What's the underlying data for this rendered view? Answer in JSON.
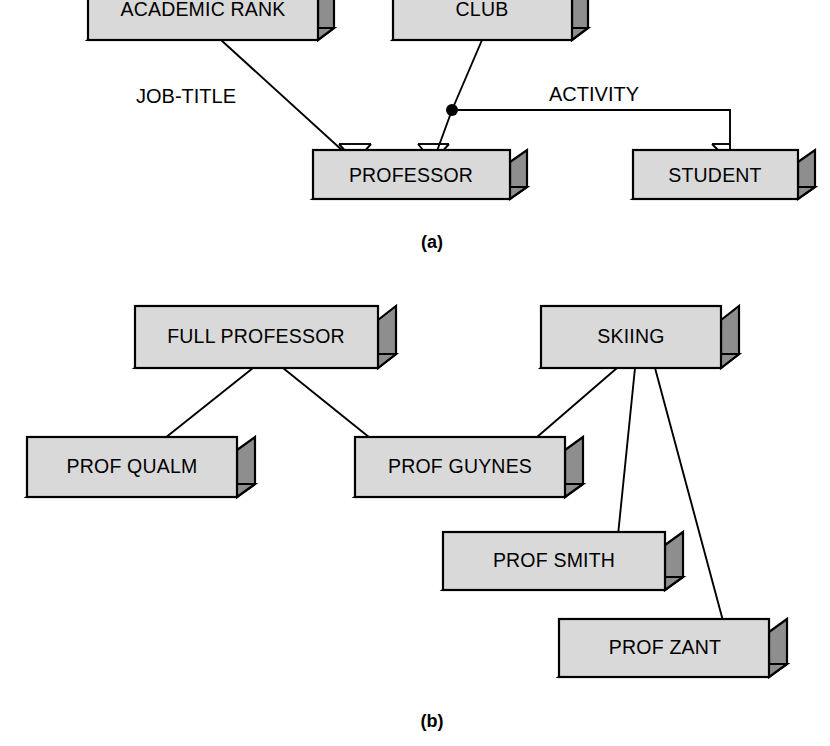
{
  "figure": {
    "background_color": "#ffffff",
    "box_front_color": "#d9d9d9",
    "box_shadow_color": "#8e8e8e",
    "line_color": "#000000"
  },
  "panels": [
    {
      "id": "a",
      "caption": "(a)",
      "caption_x": 432,
      "caption_y": 243,
      "entities": [
        {
          "id": "academic-rank",
          "label": "ACADEMIC RANK",
          "x": 88,
          "y": -14,
          "w": 230,
          "h": 54
        },
        {
          "id": "club",
          "label": "CLUB",
          "x": 393,
          "y": -14,
          "w": 179,
          "h": 54
        },
        {
          "id": "professor",
          "label": "PROFESSOR",
          "x": 313,
          "y": 162,
          "w": 197,
          "h": 37
        },
        {
          "id": "student",
          "label": "STUDENT",
          "x": 633,
          "y": 162,
          "w": 165,
          "h": 37
        }
      ],
      "relationships": [
        {
          "id": "job-title",
          "label": "JOB-TITLE",
          "label_x": 186,
          "label_y": 98
        },
        {
          "id": "activity",
          "label": "ACTIVITY",
          "label_x": 594,
          "label_y": 96
        }
      ]
    },
    {
      "id": "b",
      "caption": "(b)",
      "caption_x": 432,
      "caption_y": 722,
      "entities": [
        {
          "id": "full-professor",
          "label": "FULL PROFESSOR",
          "x": 135,
          "y": 320,
          "w": 243,
          "h": 48
        },
        {
          "id": "skiing",
          "label": "SKIING",
          "x": 541,
          "y": 320,
          "w": 180,
          "h": 48
        },
        {
          "id": "prof-qualm",
          "label": "PROF QUALM",
          "x": 27,
          "y": 450,
          "w": 210,
          "h": 47
        },
        {
          "id": "prof-guynes",
          "label": "PROF GUYNES",
          "x": 355,
          "y": 450,
          "w": 210,
          "h": 47
        },
        {
          "id": "prof-smith",
          "label": "PROF SMITH",
          "x": 443,
          "y": 545,
          "w": 222,
          "h": 45
        },
        {
          "id": "prof-zant",
          "label": "PROF ZANT",
          "x": 559,
          "y": 632,
          "w": 210,
          "h": 45
        }
      ],
      "links": [
        {
          "from": "full-professor",
          "to": "prof-qualm"
        },
        {
          "from": "full-professor",
          "to": "prof-guynes"
        },
        {
          "from": "skiing",
          "to": "prof-guynes"
        },
        {
          "from": "skiing",
          "to": "prof-smith"
        },
        {
          "from": "skiing",
          "to": "prof-zant"
        }
      ]
    }
  ]
}
